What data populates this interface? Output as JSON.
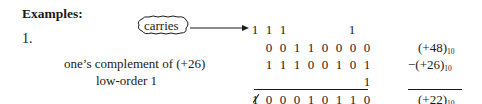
{
  "heading": "Examples:",
  "example_number": "1.",
  "callout": {
    "label": "carries",
    "icon": "cloud-callout-with-arrow"
  },
  "rows": {
    "carries": {
      "bits": [
        "1",
        "1",
        "1",
        "",
        "",
        "",
        "",
        "1",
        ""
      ]
    },
    "addend1": {
      "bits": [
        "",
        "0",
        "0",
        "1",
        "1",
        "0",
        "0",
        "0",
        "0"
      ],
      "decimal": "(+48)",
      "base": "10"
    },
    "addend2": {
      "label": "one’s complement of (+26)",
      "bits": [
        "",
        "1",
        "1",
        "1",
        "0",
        "0",
        "1",
        "0",
        "1"
      ],
      "decimal": "−(+26)",
      "base": "10"
    },
    "low_order": {
      "label": "low-order 1",
      "bits": [
        "",
        "",
        "",
        "",
        "",
        "",
        "",
        "",
        "1"
      ]
    },
    "result": {
      "bits": [
        "1",
        "0",
        "0",
        "0",
        "1",
        "0",
        "1",
        "1",
        "0"
      ],
      "struck_index": 0,
      "decimal": "(+22)",
      "base": "10"
    }
  }
}
